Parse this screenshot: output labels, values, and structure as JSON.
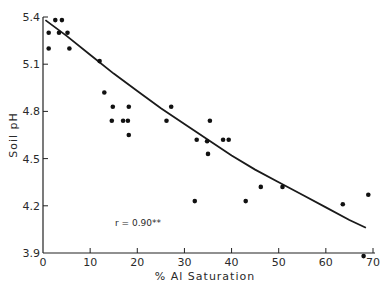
{
  "chart_data": {
    "type": "scatter",
    "title": "",
    "xlabel": "% Al Saturation",
    "ylabel": "Soil pH",
    "xlim": [
      0,
      70
    ],
    "ylim": [
      3.9,
      5.4
    ],
    "x_ticks": [
      0,
      10,
      20,
      30,
      40,
      50,
      60,
      70
    ],
    "y_ticks": [
      3.9,
      4.2,
      4.5,
      4.8,
      5.1,
      5.4
    ],
    "x_tick_labels": [
      "0",
      "10",
      "20",
      "30",
      "40",
      "50",
      "60",
      "70"
    ],
    "y_tick_labels": [
      "3.9",
      "4.2",
      "4.5",
      "4.8",
      "5.1",
      "5.4"
    ],
    "grid": false,
    "legend": null,
    "annotation": "r = 0.90**",
    "series": [
      {
        "name": "observations",
        "points": [
          [
            1.2,
            5.3
          ],
          [
            1.2,
            5.2
          ],
          [
            2.6,
            5.38
          ],
          [
            4.0,
            5.38
          ],
          [
            3.4,
            5.3
          ],
          [
            5.2,
            5.3
          ],
          [
            5.6,
            5.2
          ],
          [
            12.0,
            5.12
          ],
          [
            13.0,
            4.92
          ],
          [
            14.8,
            4.83
          ],
          [
            14.6,
            4.74
          ],
          [
            17.0,
            4.74
          ],
          [
            18.0,
            4.74
          ],
          [
            18.2,
            4.83
          ],
          [
            18.2,
            4.65
          ],
          [
            26.2,
            4.74
          ],
          [
            27.2,
            4.83
          ],
          [
            32.6,
            4.62
          ],
          [
            34.8,
            4.61
          ],
          [
            35.4,
            4.74
          ],
          [
            35.0,
            4.53
          ],
          [
            38.2,
            4.62
          ],
          [
            39.4,
            4.62
          ],
          [
            32.2,
            4.23
          ],
          [
            43.0,
            4.23
          ],
          [
            46.2,
            4.32
          ],
          [
            50.8,
            4.32
          ],
          [
            63.6,
            4.21
          ],
          [
            69.0,
            4.27
          ],
          [
            68.0,
            3.88
          ]
        ]
      },
      {
        "name": "fitted curve",
        "type": "line",
        "points": [
          [
            0.5,
            5.38
          ],
          [
            5,
            5.28
          ],
          [
            10,
            5.16
          ],
          [
            15,
            5.04
          ],
          [
            20,
            4.93
          ],
          [
            25,
            4.82
          ],
          [
            30,
            4.72
          ],
          [
            35,
            4.62
          ],
          [
            40,
            4.52
          ],
          [
            45,
            4.43
          ],
          [
            50,
            4.35
          ],
          [
            55,
            4.27
          ],
          [
            60,
            4.19
          ],
          [
            65,
            4.11
          ],
          [
            68.5,
            4.06
          ]
        ]
      }
    ]
  }
}
